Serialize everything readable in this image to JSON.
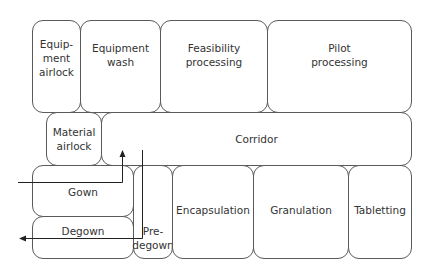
{
  "diagram": {
    "type": "facility floor plan",
    "rooms": {
      "equipment_airlock": "Equip-\nment\nairlock",
      "equipment_wash": "Equipment\nwash",
      "feasibility_processing": "Feasibility\nprocessing",
      "pilot_processing": "Pilot\nprocessing",
      "material_airlock": "Material\nairlock",
      "corridor": "Corridor",
      "gown": "Gown",
      "degown": "Degown",
      "pre_degown": "Pre-\ndegown",
      "encapsulation": "Encapsulation",
      "granulation": "Granulation",
      "tabletting": "Tabletting"
    },
    "flows": [
      {
        "name": "entry-flow",
        "description": "Enter from left through Gown, up into Corridor"
      },
      {
        "name": "exit-flow",
        "description": "From Corridor down through Pre-degown, left through Degown to exit"
      }
    ],
    "colors": {
      "line": "#5a5a5a",
      "text": "#333333",
      "arrow": "#222222"
    }
  }
}
